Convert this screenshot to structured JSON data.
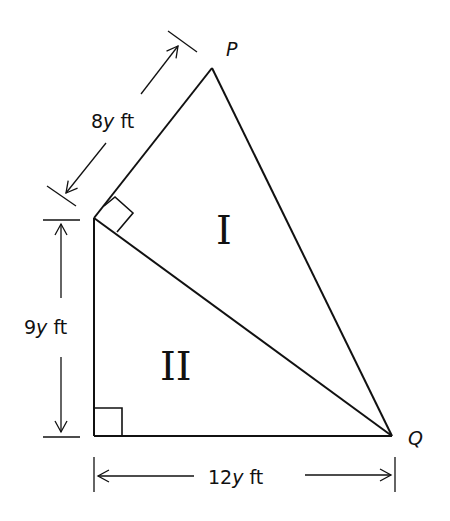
{
  "diagram": {
    "points": {
      "P": {
        "label": "P"
      },
      "Q": {
        "label": "Q"
      }
    },
    "regions": [
      {
        "id": "I",
        "label": "I"
      },
      {
        "id": "II",
        "label": "II"
      }
    ],
    "dimensions": [
      {
        "id": "slant",
        "coef": "8",
        "var": "y",
        "unit": " ft"
      },
      {
        "id": "height",
        "coef": "9",
        "var": "y",
        "unit": " ft"
      },
      {
        "id": "base",
        "coef": "12",
        "var": "y",
        "unit": " ft"
      }
    ],
    "right_angles": 2,
    "colors": {
      "stroke": "#111111",
      "background": "#ffffff"
    }
  }
}
